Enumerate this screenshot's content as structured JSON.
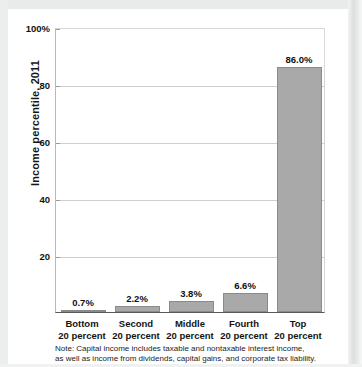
{
  "chart_data": {
    "type": "bar",
    "title": "",
    "subtitle": "",
    "xlabel": "",
    "ylabel": "Income percentile, 2011",
    "ylim": [
      0,
      100
    ],
    "grid": true,
    "legend": "none",
    "categories": [
      "Bottom 20 percent",
      "Second 20 percent",
      "Middle 20 percent",
      "Fourth 20 percent",
      "Top 20 percent"
    ],
    "category_lines": [
      {
        "line1": "Bottom",
        "line2": "20 percent"
      },
      {
        "line1": "Second",
        "line2": "20 percent"
      },
      {
        "line1": "Middle",
        "line2": "20 percent"
      },
      {
        "line1": "Fourth",
        "line2": "20 percent"
      },
      {
        "line1": "Top",
        "line2": "20 percent"
      }
    ],
    "values": [
      0.7,
      2.2,
      3.8,
      6.6,
      86.0
    ],
    "value_labels": [
      "0.7%",
      "2.2%",
      "3.8%",
      "6.6%",
      "86.0%"
    ],
    "ytick_values": [
      20,
      40,
      60,
      80,
      100
    ],
    "ytick_labels": [
      "20",
      "40",
      "60",
      "80",
      "100%"
    ],
    "bar_color": "#a9a9a9",
    "bar_border_color": "#8a8a8a",
    "gridline_color": "#cfcfcf",
    "axis_color": "#595959"
  },
  "note": {
    "line1": "Note: Capital income includes taxable and nontaxable interest income,",
    "line2": "as well as income from dividends, capital gains, and corporate tax liability."
  }
}
